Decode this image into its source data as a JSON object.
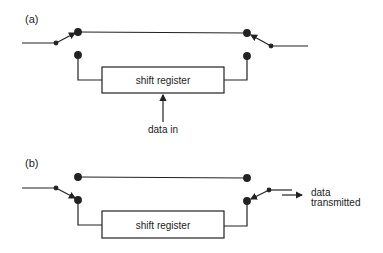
{
  "diagram": {
    "panel_a": {
      "label": "(a)",
      "box_label": "shift register",
      "input_label": "data in"
    },
    "panel_b": {
      "label": "(b)",
      "box_label": "shift register",
      "output_label_line1": "data",
      "output_label_line2": "transmitted"
    },
    "colors": {
      "stroke": "#222222",
      "background": "#ffffff"
    }
  }
}
